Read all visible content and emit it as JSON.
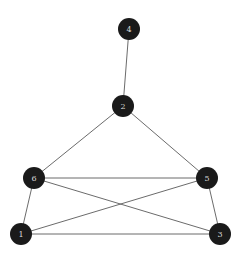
{
  "graph": {
    "background": "#ffffff",
    "node_color": "#1a1a1a",
    "label_color": "#d8d8d8",
    "edge_color": "#5a5a5a",
    "node_radius": 11,
    "nodes": [
      {
        "id": "1",
        "label": "1",
        "x": 21,
        "y": 234
      },
      {
        "id": "2",
        "label": "2",
        "x": 123,
        "y": 106
      },
      {
        "id": "3",
        "label": "3",
        "x": 220,
        "y": 234
      },
      {
        "id": "4",
        "label": "4",
        "x": 129,
        "y": 29
      },
      {
        "id": "5",
        "label": "5",
        "x": 207,
        "y": 178
      },
      {
        "id": "6",
        "label": "6",
        "x": 34,
        "y": 178
      }
    ],
    "edges": [
      {
        "source": "4",
        "target": "2"
      },
      {
        "source": "2",
        "target": "6"
      },
      {
        "source": "2",
        "target": "5"
      },
      {
        "source": "6",
        "target": "5"
      },
      {
        "source": "6",
        "target": "3"
      },
      {
        "source": "5",
        "target": "1"
      },
      {
        "source": "6",
        "target": "1"
      },
      {
        "source": "5",
        "target": "3"
      },
      {
        "source": "1",
        "target": "3"
      }
    ]
  }
}
